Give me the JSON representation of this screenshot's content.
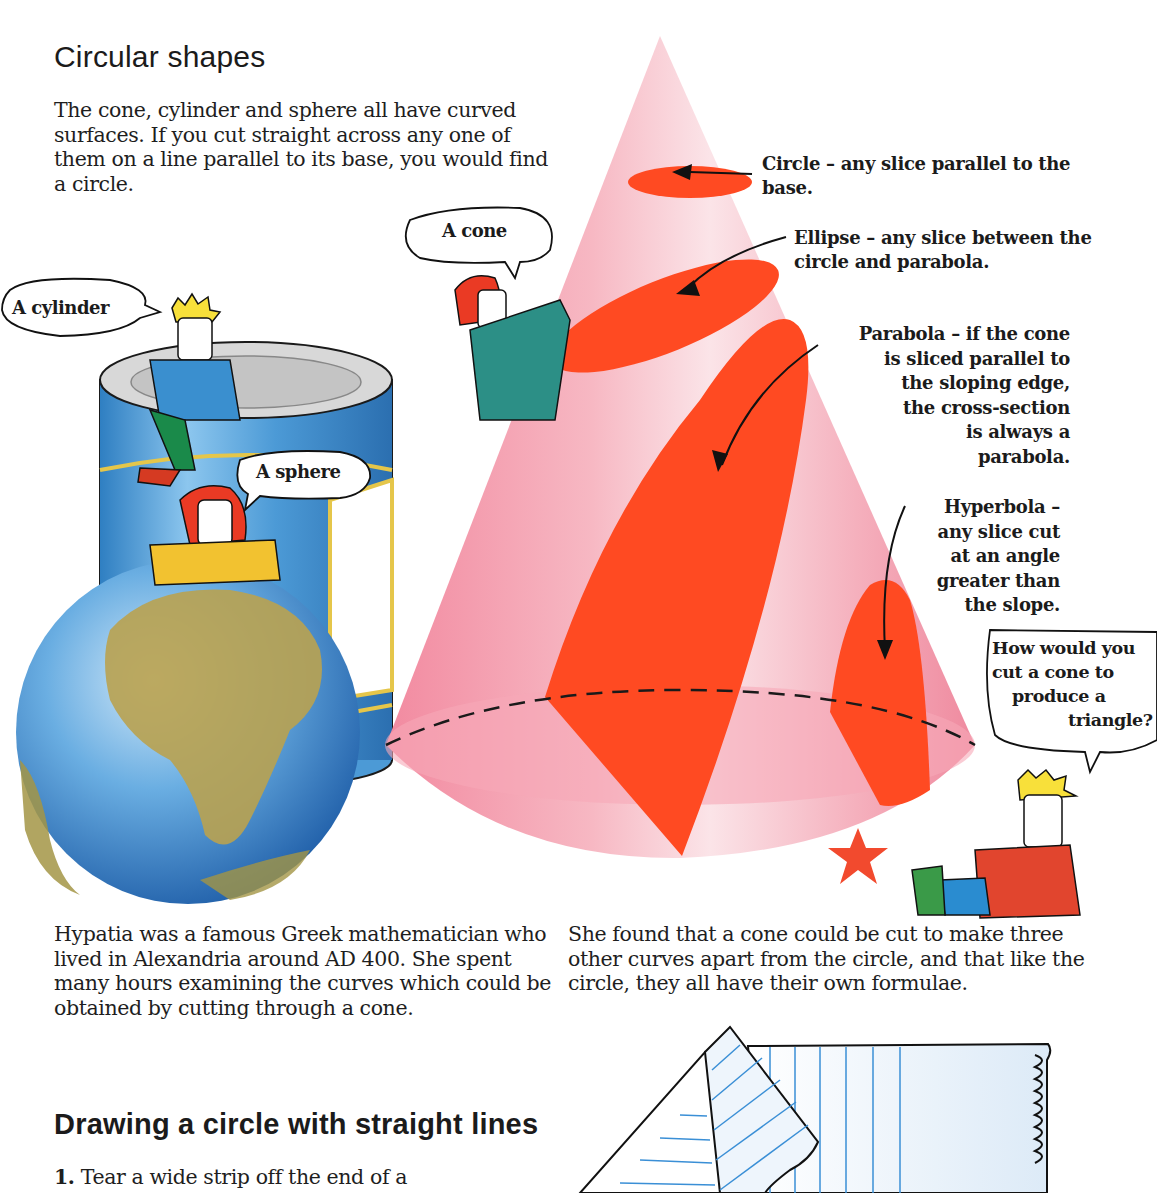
{
  "section1": {
    "title": "Circular shapes",
    "intro": "The cone, cylinder and sphere all have curved surfaces. If you cut straight across any one of them on a line parallel to its base, you would find a circle."
  },
  "speech": {
    "cylinder": "A cylinder",
    "cone": "A cone",
    "sphere": "A sphere",
    "question_lines": [
      "How would you",
      "cut a cone to",
      "produce a",
      "triangle?"
    ]
  },
  "cone_labels": {
    "circle": "Circle – any slice parallel to the base.",
    "ellipse": "Ellipse – any slice between the circle and parabola.",
    "parabola_lines": [
      "Parabola – if the cone",
      "is sliced parallel to",
      "the sloping edge,",
      "the cross-section",
      "is always a",
      "parabola."
    ],
    "hyperbola_lines": [
      "Hyperbola –",
      "any slice cut",
      "at an angle",
      "greater than",
      "the slope."
    ]
  },
  "text": {
    "hypatia": "Hypatia was a famous Greek mathematician who lived in Alexandria around AD 400. She spent many hours examining the curves which could be obtained by cutting through a cone.",
    "found": "She found that a cone could be cut to make three other curves apart from the circle, and that like the circle, they all have their own formulae."
  },
  "section2": {
    "title": "Drawing a circle with straight lines",
    "step1_number": "1.",
    "step1_text": " Tear a wide strip off the end of a"
  },
  "colors": {
    "cone_pink": "#f4a6b4",
    "slice_red": "#ff4a22",
    "can_blue": "#4a9ad4",
    "globe_blue": "#3d86cf",
    "land": "#b9a250",
    "paper_line": "#3a8fd6",
    "star": "#f24a2e"
  }
}
